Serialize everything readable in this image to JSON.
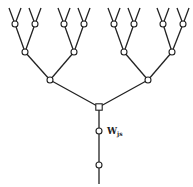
{
  "diagram": {
    "type": "binary-tree",
    "label": {
      "main": "W",
      "subscript": "js"
    },
    "colors": {
      "line": "#222222",
      "node_fill": "#ffffff",
      "background": "#ffffff"
    },
    "root": {
      "x": 99,
      "y": 107,
      "shape": "square"
    },
    "stem_nodes": [
      {
        "x": 99,
        "y": 131
      },
      {
        "x": 99,
        "y": 165
      }
    ],
    "stem_end": {
      "x": 99,
      "y": 184
    },
    "level3": [
      {
        "x": 50,
        "y": 80
      },
      {
        "x": 148,
        "y": 80
      }
    ],
    "level2": [
      {
        "x": 25,
        "y": 52
      },
      {
        "x": 74,
        "y": 52
      },
      {
        "x": 124,
        "y": 52
      },
      {
        "x": 172,
        "y": 52
      }
    ],
    "level1": [
      {
        "x": 15,
        "y": 24
      },
      {
        "x": 35,
        "y": 24
      },
      {
        "x": 64,
        "y": 24
      },
      {
        "x": 84,
        "y": 24
      },
      {
        "x": 114,
        "y": 24
      },
      {
        "x": 134,
        "y": 24
      },
      {
        "x": 163,
        "y": 24
      },
      {
        "x": 183,
        "y": 24
      }
    ]
  }
}
